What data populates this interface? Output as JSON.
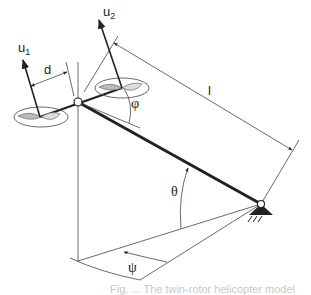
{
  "diagram": {
    "labels": {
      "u1_main": "u",
      "u1_sub": "1",
      "u2_main": "u",
      "u2_sub": "2",
      "d": "d",
      "l": "l",
      "phi": "φ",
      "theta": "θ",
      "psi": "ψ"
    },
    "caption": "Fig. ... The twin-rotor helicopter model"
  }
}
